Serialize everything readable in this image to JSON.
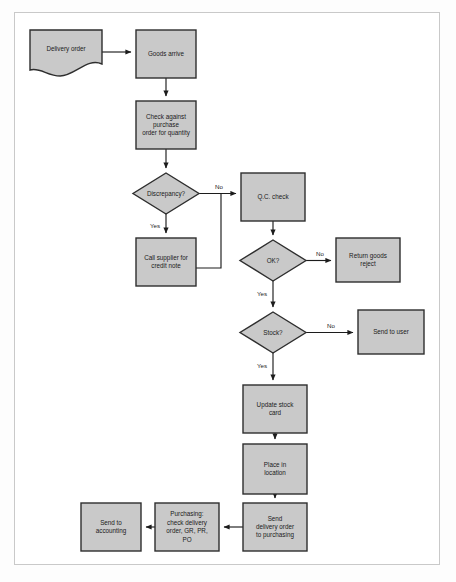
{
  "diagram": {
    "colors": {
      "node_fill": "#c9c9c9",
      "node_stroke": "#2e2e2e",
      "line": "#1c1c1c",
      "frame": "#c9c9c9",
      "page_background": "#ffffff",
      "text": "#1a1a1a"
    },
    "nodes": [
      {
        "id": "delivery-order",
        "shape": "document",
        "label": "Delivery order",
        "lines": [
          "Delivery order"
        ],
        "x": 30,
        "y": 30,
        "w": 72,
        "h": 48
      },
      {
        "id": "goods-arrive",
        "shape": "process",
        "label": "Goods arrive",
        "lines": [
          "Goods arrive"
        ],
        "x": 136,
        "y": 30,
        "w": 60,
        "h": 48
      },
      {
        "id": "check-against-po",
        "shape": "process",
        "label": "Check against purchase order for quantity",
        "lines": [
          "Check against",
          "purchase",
          "order for quantity"
        ],
        "x": 136,
        "y": 101,
        "w": 60,
        "h": 48
      },
      {
        "id": "discrepancy",
        "shape": "decision",
        "label": "Discrepancy?",
        "lines": [
          "Discrepancy?"
        ],
        "x": 133,
        "y": 173,
        "w": 66,
        "h": 41
      },
      {
        "id": "call-supplier",
        "shape": "process",
        "label": "Call supplier for credit note",
        "lines": [
          "Call supplier for",
          "credit note"
        ],
        "x": 136,
        "y": 238,
        "w": 60,
        "h": 48
      },
      {
        "id": "qc-check",
        "shape": "process",
        "label": "Q.C. check",
        "lines": [
          "Q.C. check"
        ],
        "x": 241,
        "y": 173,
        "w": 64,
        "h": 48
      },
      {
        "id": "ok",
        "shape": "decision",
        "label": "OK?",
        "lines": [
          "OK?"
        ],
        "x": 240,
        "y": 240,
        "w": 66,
        "h": 41
      },
      {
        "id": "return-goods",
        "shape": "process",
        "label": "Return goods reject",
        "lines": [
          "Return goods",
          "reject"
        ],
        "x": 336,
        "y": 238,
        "w": 64,
        "h": 44
      },
      {
        "id": "stock",
        "shape": "decision",
        "label": "Stock?",
        "lines": [
          "Stock?"
        ],
        "x": 240,
        "y": 312,
        "w": 66,
        "h": 41
      },
      {
        "id": "send-to-user",
        "shape": "process",
        "label": "Send to user",
        "lines": [
          "Send to user"
        ],
        "x": 358,
        "y": 310,
        "w": 66,
        "h": 44
      },
      {
        "id": "update-stock-card",
        "shape": "process",
        "label": "Update stock card",
        "lines": [
          "Update stock",
          "card"
        ],
        "x": 243,
        "y": 385,
        "w": 64,
        "h": 48
      },
      {
        "id": "place-in-location",
        "shape": "process",
        "label": "Place in location",
        "lines": [
          "Place in",
          "location"
        ],
        "x": 243,
        "y": 444,
        "w": 64,
        "h": 50
      },
      {
        "id": "send-do-purchasing",
        "shape": "process",
        "label": "Send delivery order to purchasing",
        "lines": [
          "Send",
          "delivery order",
          "to purchasing"
        ],
        "x": 243,
        "y": 503,
        "w": 64,
        "h": 48
      },
      {
        "id": "purchasing-check",
        "shape": "process",
        "label": "Purchasing: check delivery order, GR, PR, PO",
        "lines": [
          "Purchasing:",
          "check delivery",
          "order, GR, PR,",
          "PO"
        ],
        "x": 155,
        "y": 503,
        "w": 64,
        "h": 48
      },
      {
        "id": "send-to-accounting",
        "shape": "process",
        "label": "Send to accounting",
        "lines": [
          "Send to",
          "accounting"
        ],
        "x": 81,
        "y": 503,
        "w": 60,
        "h": 48
      }
    ],
    "edges": [
      {
        "id": "e-delivery-to-goods",
        "from": "delivery-order",
        "to": "goods-arrive",
        "label": ""
      },
      {
        "id": "e-goods-to-check",
        "from": "goods-arrive",
        "to": "check-against-po",
        "label": ""
      },
      {
        "id": "e-check-to-discrepancy",
        "from": "check-against-po",
        "to": "discrepancy",
        "label": ""
      },
      {
        "id": "e-discrepancy-yes",
        "from": "discrepancy",
        "to": "call-supplier",
        "label": "Yes"
      },
      {
        "id": "e-discrepancy-no",
        "from": "discrepancy",
        "to": "qc-check",
        "label": "No"
      },
      {
        "id": "e-call-supplier-rejoin",
        "from": "call-supplier",
        "to": "qc-check",
        "label": ""
      },
      {
        "id": "e-qc-to-ok",
        "from": "qc-check",
        "to": "ok",
        "label": ""
      },
      {
        "id": "e-ok-no",
        "from": "ok",
        "to": "return-goods",
        "label": "No"
      },
      {
        "id": "e-ok-yes",
        "from": "ok",
        "to": "stock",
        "label": "Yes"
      },
      {
        "id": "e-stock-no",
        "from": "stock",
        "to": "send-to-user",
        "label": "No"
      },
      {
        "id": "e-stock-yes",
        "from": "stock",
        "to": "update-stock-card",
        "label": "Yes"
      },
      {
        "id": "e-update-to-place",
        "from": "update-stock-card",
        "to": "place-in-location",
        "label": ""
      },
      {
        "id": "e-place-to-send",
        "from": "place-in-location",
        "to": "send-do-purchasing",
        "label": ""
      },
      {
        "id": "e-send-to-purchasing",
        "from": "send-do-purchasing",
        "to": "purchasing-check",
        "label": ""
      },
      {
        "id": "e-purchasing-to-acct",
        "from": "purchasing-check",
        "to": "send-to-accounting",
        "label": ""
      }
    ],
    "edge_label_text": {
      "yes": "Yes",
      "no": "No"
    }
  }
}
